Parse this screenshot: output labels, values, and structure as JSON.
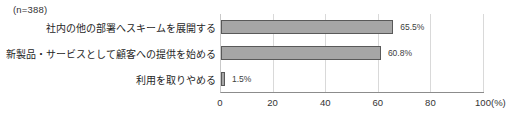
{
  "chart": {
    "n_label": "(n=388)",
    "unit_label": "(%)"
  },
  "chart_data": {
    "type": "bar",
    "orientation": "horizontal",
    "title": "",
    "n": 388,
    "categories": [
      "社内の他の部署へスキームを展開する",
      "新製品・サービスとして顧客への提供を始める",
      "利用を取りやめる"
    ],
    "values": [
      65.5,
      60.8,
      1.5
    ],
    "value_labels": [
      "65.5%",
      "60.8%",
      "1.5%"
    ],
    "xlabel": "(%)",
    "ylabel": "",
    "xlim": [
      0,
      100
    ],
    "x_ticks": [
      0,
      20,
      40,
      60,
      80,
      100
    ],
    "grid": true,
    "legend": false,
    "bar_color": "#a6a6a6",
    "bar_border_color": "#595959",
    "gridline_color": "#d9d9d9"
  }
}
